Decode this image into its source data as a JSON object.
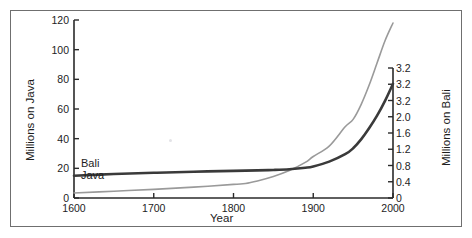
{
  "chart_data": {
    "type": "line",
    "title": "",
    "xlabel": "Year",
    "ylabel": "Millions on Java",
    "y2label": "Millions on Bali",
    "xlim": [
      1600,
      2000
    ],
    "ylim": [
      0,
      120
    ],
    "y2lim": [
      0,
      3.2
    ],
    "grid": false,
    "legend": "inline-labels",
    "xticks": [
      "1600",
      "1700",
      "1800",
      "1900",
      "2000"
    ],
    "xtick_values": [
      1600,
      1700,
      1800,
      1900,
      2000
    ],
    "yticks_left": [
      "0",
      "20",
      "40",
      "60",
      "80",
      "100",
      "120"
    ],
    "ytick_left_values": [
      0,
      20,
      40,
      60,
      80,
      100,
      120
    ],
    "yticks_right": [
      "0",
      "0.4",
      "0.8",
      "1.2",
      "1.6",
      "2.0",
      "3.2",
      "3.2",
      "3.2"
    ],
    "ytick_right_values": [
      0,
      0.4,
      0.8,
      1.2,
      1.6,
      2.0,
      2.4,
      2.8,
      3.2
    ],
    "series": [
      {
        "name": "Java",
        "label": "Java",
        "axis": "left",
        "color": "#9a9a9a",
        "width": 1.6,
        "x": [
          1600,
          1650,
          1700,
          1750,
          1800,
          1815,
          1830,
          1850,
          1870,
          1890,
          1900,
          1920,
          1940,
          1950,
          1960,
          1970,
          1980,
          1990,
          2000
        ],
        "values": [
          3.4,
          4.6,
          5.8,
          7.3,
          9.2,
          9.8,
          11.5,
          14.5,
          18.5,
          24.0,
          28.0,
          35.0,
          48.0,
          53.0,
          63.0,
          76.0,
          91.0,
          106.0,
          118.0
        ]
      },
      {
        "name": "Bali",
        "label": "Bali",
        "axis": "right",
        "color": "#3a3a3a",
        "width": 2.6,
        "x": [
          1600,
          1650,
          1700,
          1750,
          1800,
          1830,
          1850,
          1870,
          1890,
          1900,
          1920,
          1940,
          1950,
          1960,
          1970,
          1980,
          1990,
          2000
        ],
        "values_left_scale": [
          15.0,
          16.2,
          17.0,
          17.7,
          18.3,
          18.6,
          18.9,
          19.4,
          20.4,
          21.3,
          24.5,
          29.5,
          33.5,
          39.5,
          47.0,
          55.5,
          65.5,
          77.0
        ],
        "values": [
          0.4,
          0.43,
          0.45,
          0.47,
          0.49,
          0.5,
          0.5,
          0.52,
          0.54,
          0.57,
          0.65,
          0.79,
          0.89,
          1.05,
          1.25,
          1.48,
          1.75,
          2.05
        ]
      }
    ]
  },
  "axes": {
    "left_title": "Millions on Java",
    "right_title": "Millions on Bali",
    "bottom_title": "Year"
  },
  "colors": {
    "java_line": "#9a9a9a",
    "bali_line": "#3a3a3a",
    "axis": "#2a2a2a",
    "frame": "#6f6f6f",
    "background": "#ffffff"
  }
}
